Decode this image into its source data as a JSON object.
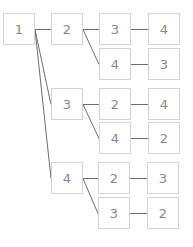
{
  "diagram": {
    "type": "tree",
    "colors": {
      "node_border": "#d4d4d4",
      "node_text": "#8a8a8a",
      "edge": "#6e6e6e",
      "background": "#ffffff"
    },
    "nodes": [
      {
        "id": "n1",
        "label": "1",
        "x": 3,
        "y": 13
      },
      {
        "id": "n2",
        "label": "2",
        "x": 51,
        "y": 13
      },
      {
        "id": "n3",
        "label": "3",
        "x": 51,
        "y": 88
      },
      {
        "id": "n4",
        "label": "4",
        "x": 51,
        "y": 162
      },
      {
        "id": "n2a",
        "label": "3",
        "x": 99,
        "y": 13
      },
      {
        "id": "n2b",
        "label": "4",
        "x": 99,
        "y": 48
      },
      {
        "id": "n2a1",
        "label": "4",
        "x": 148,
        "y": 13
      },
      {
        "id": "n2b1",
        "label": "3",
        "x": 148,
        "y": 48
      },
      {
        "id": "n3a",
        "label": "2",
        "x": 99,
        "y": 88
      },
      {
        "id": "n3b",
        "label": "4",
        "x": 99,
        "y": 122
      },
      {
        "id": "n3a1",
        "label": "4",
        "x": 148,
        "y": 88
      },
      {
        "id": "n3b1",
        "label": "2",
        "x": 148,
        "y": 122
      },
      {
        "id": "n4a",
        "label": "2",
        "x": 98,
        "y": 162
      },
      {
        "id": "n4b",
        "label": "3",
        "x": 98,
        "y": 197
      },
      {
        "id": "n4a1",
        "label": "3",
        "x": 147,
        "y": 162
      },
      {
        "id": "n4b1",
        "label": "2",
        "x": 147,
        "y": 197
      }
    ],
    "edges": [
      [
        "n1",
        "n2"
      ],
      [
        "n1",
        "n3"
      ],
      [
        "n1",
        "n4"
      ],
      [
        "n2",
        "n2a"
      ],
      [
        "n2",
        "n2b"
      ],
      [
        "n2a",
        "n2a1"
      ],
      [
        "n2b",
        "n2b1"
      ],
      [
        "n3",
        "n3a"
      ],
      [
        "n3",
        "n3b"
      ],
      [
        "n3a",
        "n3a1"
      ],
      [
        "n3b",
        "n3b1"
      ],
      [
        "n4",
        "n4a"
      ],
      [
        "n4",
        "n4b"
      ],
      [
        "n4a",
        "n4a1"
      ],
      [
        "n4b",
        "n4b1"
      ]
    ]
  }
}
